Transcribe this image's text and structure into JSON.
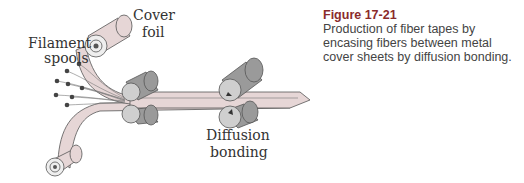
{
  "diagram": {
    "labels": {
      "cover_foil": [
        "Cover",
        "foil"
      ],
      "filament_spools": [
        "Filament",
        "spools"
      ],
      "diffusion_bonding": [
        "Diffusion",
        "bonding"
      ]
    },
    "colors": {
      "foil": "#e6d6d6",
      "foil_stroke": "#555555",
      "roller": "#9a9a9a",
      "roller_end": "#cfcfcf",
      "spool_dot": "#444444"
    }
  },
  "caption": {
    "figure_label": "Figure 17-21",
    "text": "Production of fiber tapes by encasing fibers between metal cover sheets by diffusion bonding.",
    "label_color": "#8a2b2b"
  }
}
